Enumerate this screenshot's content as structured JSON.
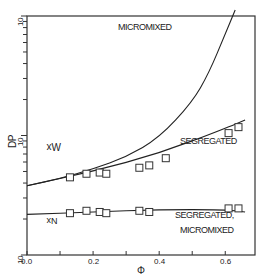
{
  "chart_data": {
    "type": "line",
    "title": "",
    "xlabel": "Φ",
    "ylabel": "DP",
    "xlim": [
      0.0,
      0.69
    ],
    "ylim_log": [
      -7,
      -5
    ],
    "y_scale": "log",
    "grid": false,
    "x_tick_labels": [
      "0.0",
      "0.2",
      "0.4",
      "0.6"
    ],
    "x_ticks": [
      0.0,
      0.1,
      0.2,
      0.3,
      0.4,
      0.5,
      0.6
    ],
    "y_tick_labels": [
      {
        "text": "10",
        "exp": "-5",
        "value": 1e-05
      },
      {
        "text": "10",
        "exp": "-6",
        "value": 1e-06
      },
      {
        "text": "10",
        "exp": "-7",
        "value": 1e-07
      }
    ],
    "series": [
      {
        "name": "x_W micromixed",
        "kind": "line",
        "x": [
          0.0,
          0.1,
          0.2,
          0.3,
          0.4,
          0.5,
          0.55,
          0.6,
          0.63
        ],
        "y_log": [
          -6.42,
          -6.36,
          -6.28,
          -6.18,
          -6.02,
          -5.72,
          -5.48,
          -5.15,
          -4.95
        ]
      },
      {
        "name": "x_W segregated",
        "kind": "line",
        "x": [
          0.0,
          0.2,
          0.4,
          0.6,
          0.66
        ],
        "y_log": [
          -6.42,
          -6.3,
          -6.15,
          -5.94,
          -5.87
        ]
      },
      {
        "name": "x_N segregated, micromixed",
        "kind": "line",
        "x": [
          0.0,
          0.2,
          0.4,
          0.6,
          0.66
        ],
        "y_log": [
          -6.66,
          -6.64,
          -6.62,
          -6.62,
          -6.64
        ]
      },
      {
        "name": "x_W data",
        "kind": "scatter",
        "x": [
          0.13,
          0.18,
          0.22,
          0.24,
          0.34,
          0.37,
          0.42,
          0.61,
          0.64
        ],
        "y_log": [
          -6.35,
          -6.32,
          -6.31,
          -6.32,
          -6.27,
          -6.25,
          -6.19,
          -5.98,
          -5.93
        ]
      },
      {
        "name": "x_N data",
        "kind": "scatter",
        "x": [
          0.13,
          0.18,
          0.22,
          0.24,
          0.34,
          0.37,
          0.61,
          0.64
        ],
        "y_log": [
          -6.65,
          -6.63,
          -6.64,
          -6.65,
          -6.63,
          -6.64,
          -6.61,
          -6.61
        ]
      }
    ],
    "annotations": [
      {
        "text": "MICROMIXED",
        "x": 0.22,
        "y_log": -5.12
      },
      {
        "text": "SEGREGATED",
        "x": 0.43,
        "y_log": -6.25
      },
      {
        "text": "SEGREGATED,",
        "x": 0.38,
        "y_log": -6.73
      },
      {
        "text": "MICROMIXED",
        "x": 0.41,
        "y_log": -6.82
      },
      {
        "text": "x_W",
        "x": 0.05,
        "y_log": -6.18
      },
      {
        "text": "x_N",
        "x": 0.05,
        "y_log": -6.8
      }
    ],
    "legend": "none"
  },
  "labels": {
    "ylabel": "DP",
    "xlabel": "Φ",
    "xw": "x",
    "xw_sub": "W",
    "xn": "x",
    "xn_sub": "N",
    "micromixed_top": "MICROMIXED",
    "segregated": "SEGREGATED",
    "segregated_bottom": "SEGREGATED,",
    "micromixed_bottom": "MICROMIXED",
    "x_ticks": [
      "0.0",
      "0.2",
      "0.4",
      "0.6"
    ],
    "y_top": "10",
    "y_mid": "10",
    "y_bot": "10"
  }
}
